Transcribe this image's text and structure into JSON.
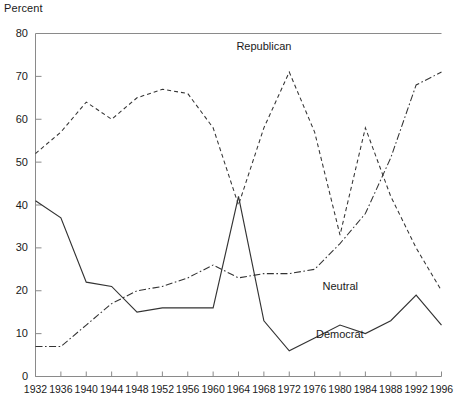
{
  "chart_data": {
    "type": "line",
    "title": "",
    "ylabel": "Percent",
    "xlabel": "",
    "ylim": [
      0,
      80
    ],
    "ytick_labels": [
      "0",
      "10",
      "20",
      "30",
      "40",
      "50",
      "60",
      "70",
      "80"
    ],
    "yticks": [
      0,
      10,
      20,
      30,
      40,
      50,
      60,
      70,
      80
    ],
    "grid": false,
    "legend_position": "inline-annotations",
    "categories": [
      "1932",
      "1936",
      "1940",
      "1944",
      "1948",
      "1952",
      "1956",
      "1960",
      "1964",
      "1968",
      "1972",
      "1976",
      "1980",
      "1984",
      "1988",
      "1992",
      "1996"
    ],
    "x": [
      1932,
      1936,
      1940,
      1944,
      1948,
      1952,
      1956,
      1960,
      1964,
      1968,
      1972,
      1976,
      1980,
      1984,
      1988,
      1992,
      1996
    ],
    "series": [
      {
        "name": "Republican",
        "style": "dashed",
        "color": "#333333",
        "values": [
          52,
          57,
          64,
          60,
          65,
          67,
          66,
          58,
          40,
          58,
          71,
          57,
          33,
          58,
          42,
          30,
          20
        ]
      },
      {
        "name": "Neutral",
        "style": "dash-dot",
        "color": "#333333",
        "values": [
          7,
          7,
          12,
          17,
          20,
          21,
          23,
          26,
          23,
          24,
          24,
          25,
          31,
          38,
          51,
          68,
          71
        ]
      },
      {
        "name": "Democrat",
        "style": "solid",
        "color": "#333333",
        "values": [
          41,
          37,
          22,
          21,
          15,
          16,
          16,
          16,
          42,
          13,
          6,
          9,
          12,
          10,
          13,
          19,
          12
        ]
      }
    ],
    "annotations": [
      {
        "text": "Republican",
        "x": 1968,
        "y": 77
      },
      {
        "text": "Neutral",
        "x": 1980,
        "y": 21
      },
      {
        "text": "Democrat",
        "x": 1980,
        "y": 10
      }
    ]
  }
}
